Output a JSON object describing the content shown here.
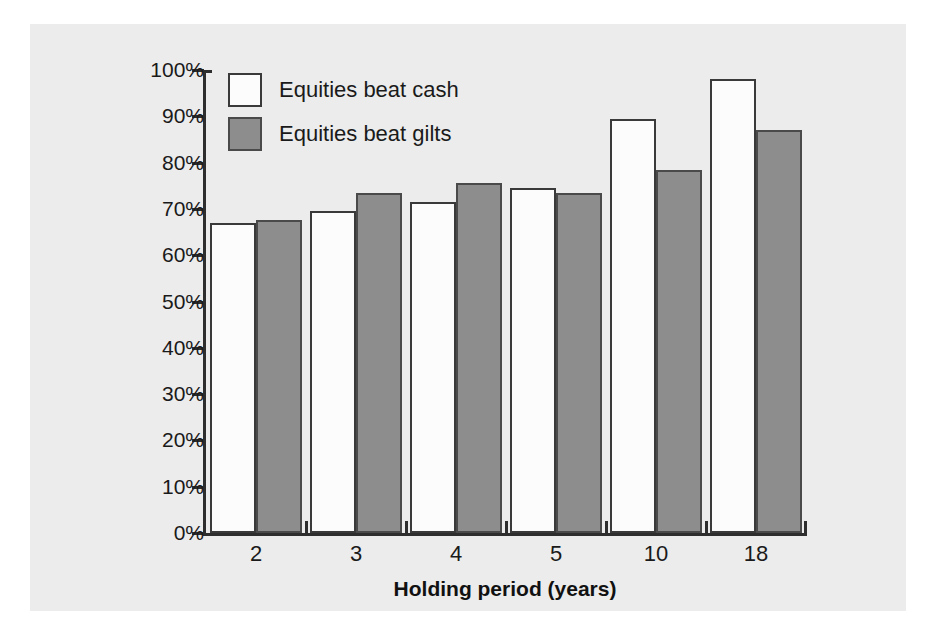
{
  "chart_data": {
    "type": "bar",
    "title": "",
    "subtitle": "",
    "xlabel": "Holding period (years)",
    "ylabel": "",
    "categories": [
      "2",
      "3",
      "4",
      "5",
      "10",
      "18"
    ],
    "series": [
      {
        "name": "Equities beat cash",
        "color": "#ffffff",
        "values": [
          67,
          69.5,
          71.5,
          74.5,
          89.5,
          98
        ]
      },
      {
        "name": "Equities beat gilts",
        "color": "#8d8d8d",
        "values": [
          67.5,
          73.5,
          75.5,
          73.5,
          78.5,
          87
        ]
      }
    ],
    "ylim": [
      0,
      100
    ],
    "ytick_labels": [
      "100%",
      "90%",
      "80%",
      "70%",
      "60%",
      "50%",
      "40%",
      "30%",
      "20%",
      "10%",
      "0%"
    ],
    "ytick_values": [
      100,
      90,
      80,
      70,
      60,
      50,
      40,
      30,
      20,
      10,
      0
    ],
    "yaxis_unit": "%",
    "grid": false,
    "legend_position": "top-left-inside",
    "annotations": []
  },
  "legend": {
    "entries": [
      {
        "label": "Equities beat cash",
        "swatch": "white-square-outline"
      },
      {
        "label": "Equities beat gilts",
        "swatch": "gray-filled-square"
      }
    ]
  },
  "colors": {
    "background": "#ffffff",
    "panel": "#ececec",
    "axis": "#2e2e2e",
    "text": "#1a1a1a",
    "bar_cash_fill": "#fcfcfc",
    "bar_cash_stroke": "#3a3a3a",
    "bar_gilts_fill": "#8d8d8d",
    "bar_gilts_stroke": "#4a4a4a"
  }
}
